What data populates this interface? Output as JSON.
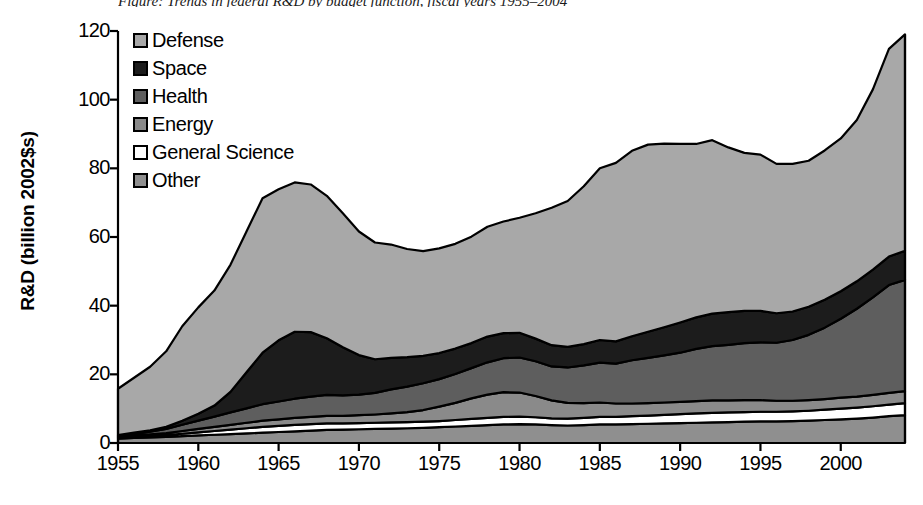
{
  "caption_fragment": "Figure: Trends in federal R&D by budget function, fiscal years 1955–2004",
  "axes": {
    "y_title": "R&D (billion 2002$s)",
    "y_ticks": [
      0,
      20,
      40,
      60,
      80,
      100,
      120
    ],
    "y_min": 0,
    "y_max": 120,
    "x_ticks": [
      1955,
      1960,
      1965,
      1970,
      1975,
      1980,
      1985,
      1990,
      1995,
      2000
    ],
    "x_min": 1955,
    "x_max": 2004
  },
  "legend": {
    "items": [
      {
        "label": "Defense",
        "color": "#a8a8a8"
      },
      {
        "label": "Space",
        "color": "#1c1c1c"
      },
      {
        "label": "Health",
        "color": "#5e5e5e"
      },
      {
        "label": "Energy",
        "color": "#8a8a8a"
      },
      {
        "label": "General Science",
        "color": "#ffffff"
      },
      {
        "label": "Other",
        "color": "#8f8f8f"
      }
    ]
  },
  "chart_data": {
    "type": "area",
    "stacked": true,
    "title": "",
    "xlabel": "",
    "ylabel": "R&D (billion 2002$s)",
    "xlim": [
      1955,
      2004
    ],
    "ylim": [
      0,
      120
    ],
    "grid": false,
    "legend_position": "top-left inside plot",
    "stack_order_bottom_to_top": [
      "Other",
      "General Science",
      "Energy",
      "Health",
      "Space",
      "Defense"
    ],
    "x": [
      1955,
      1956,
      1957,
      1958,
      1959,
      1960,
      1961,
      1962,
      1963,
      1964,
      1965,
      1966,
      1967,
      1968,
      1969,
      1970,
      1971,
      1972,
      1973,
      1974,
      1975,
      1976,
      1977,
      1978,
      1979,
      1980,
      1981,
      1982,
      1983,
      1984,
      1985,
      1986,
      1987,
      1988,
      1989,
      1990,
      1991,
      1992,
      1993,
      1994,
      1995,
      1996,
      1997,
      1998,
      1999,
      2000,
      2001,
      2002,
      2003,
      2004
    ],
    "series": [
      {
        "name": "Other",
        "color": "#8f8f8f",
        "values": [
          1.3,
          1.5,
          1.6,
          1.8,
          2.0,
          2.2,
          2.4,
          2.6,
          2.8,
          3.0,
          3.2,
          3.4,
          3.6,
          3.8,
          3.9,
          4.0,
          4.1,
          4.2,
          4.3,
          4.4,
          4.6,
          4.8,
          5.0,
          5.2,
          5.4,
          5.5,
          5.4,
          5.2,
          5.1,
          5.2,
          5.4,
          5.4,
          5.5,
          5.6,
          5.7,
          5.8,
          5.9,
          6.0,
          6.1,
          6.2,
          6.3,
          6.3,
          6.4,
          6.5,
          6.7,
          6.9,
          7.1,
          7.4,
          7.8,
          8.1
        ]
      },
      {
        "name": "General Science",
        "color": "#ffffff",
        "values": [
          0.2,
          0.3,
          0.4,
          0.5,
          0.7,
          0.9,
          1.1,
          1.3,
          1.5,
          1.7,
          1.8,
          1.9,
          1.9,
          1.9,
          1.8,
          1.8,
          1.8,
          1.8,
          1.8,
          1.8,
          1.8,
          1.9,
          2.0,
          2.1,
          2.2,
          2.2,
          2.1,
          2.0,
          2.0,
          2.1,
          2.2,
          2.2,
          2.3,
          2.4,
          2.5,
          2.6,
          2.7,
          2.8,
          2.8,
          2.8,
          2.8,
          2.8,
          2.8,
          2.9,
          3.0,
          3.1,
          3.2,
          3.3,
          3.4,
          3.5
        ]
      },
      {
        "name": "Energy",
        "color": "#8a8a8a",
        "values": [
          0.3,
          0.4,
          0.5,
          0.6,
          0.8,
          1.0,
          1.2,
          1.4,
          1.6,
          1.8,
          1.9,
          2.0,
          2.1,
          2.2,
          2.2,
          2.3,
          2.4,
          2.6,
          2.9,
          3.4,
          4.2,
          5.0,
          6.0,
          6.8,
          7.2,
          7.0,
          6.2,
          5.2,
          4.6,
          4.3,
          4.2,
          3.9,
          3.7,
          3.6,
          3.6,
          3.6,
          3.6,
          3.6,
          3.5,
          3.5,
          3.4,
          3.2,
          3.1,
          3.1,
          3.1,
          3.2,
          3.2,
          3.3,
          3.4,
          3.5
        ]
      },
      {
        "name": "Health",
        "color": "#5e5e5e",
        "values": [
          0.3,
          0.5,
          0.8,
          1.2,
          1.8,
          2.4,
          3.0,
          3.6,
          4.2,
          4.8,
          5.2,
          5.6,
          5.9,
          6.1,
          6.0,
          6.0,
          6.3,
          7.0,
          7.4,
          7.8,
          8.0,
          8.4,
          8.8,
          9.4,
          9.9,
          10.2,
          10.1,
          9.9,
          10.3,
          11.0,
          11.6,
          11.6,
          12.6,
          13.2,
          13.7,
          14.3,
          15.2,
          15.8,
          16.2,
          16.6,
          16.8,
          16.9,
          17.7,
          19.0,
          20.8,
          23.0,
          25.6,
          28.4,
          31.4,
          32.4
        ]
      },
      {
        "name": "Space",
        "color": "#1c1c1c",
        "values": [
          0.2,
          0.3,
          0.4,
          0.6,
          1.2,
          2.0,
          3.2,
          6.0,
          10.5,
          15.0,
          17.8,
          19.5,
          18.8,
          16.5,
          14.0,
          11.5,
          9.8,
          9.2,
          8.6,
          8.0,
          7.6,
          7.4,
          7.3,
          7.5,
          7.3,
          7.2,
          6.6,
          6.2,
          6.0,
          6.2,
          6.6,
          6.5,
          7.0,
          7.6,
          8.2,
          8.8,
          9.2,
          9.5,
          9.5,
          9.4,
          9.2,
          8.6,
          8.3,
          8.2,
          8.1,
          8.0,
          8.0,
          8.1,
          8.3,
          8.5
        ]
      },
      {
        "name": "Defense",
        "color": "#a8a8a8",
        "values": [
          13.5,
          16.0,
          18.5,
          22.0,
          27.5,
          31.0,
          33.5,
          37.0,
          41.0,
          45.0,
          44.0,
          43.5,
          43.0,
          41.5,
          39.0,
          36.0,
          34.0,
          33.0,
          31.5,
          30.5,
          30.5,
          30.5,
          31.0,
          32.0,
          32.5,
          33.5,
          36.5,
          40.0,
          42.5,
          46.0,
          50.0,
          52.0,
          54.0,
          54.5,
          53.5,
          52.0,
          50.5,
          50.5,
          48.0,
          46.0,
          45.5,
          43.5,
          43.0,
          42.5,
          43.5,
          44.5,
          47.0,
          52.5,
          60.5,
          63.0
        ]
      }
    ],
    "totals": [
      15.8,
      19.0,
      22.2,
      26.7,
      34.0,
      39.5,
      44.4,
      51.9,
      62.6,
      71.3,
      73.9,
      75.9,
      75.3,
      72.0,
      68.9,
      63.6,
      60.4,
      59.8,
      58.5,
      57.9,
      58.7,
      61.0,
      64.1,
      69.0,
      72.5,
      73.6,
      72.9,
      68.5,
      70.5,
      74.8,
      80.0,
      81.6,
      85.1,
      86.9,
      87.2,
      87.1,
      87.1,
      88.2,
      86.1,
      84.5,
      84.0,
      81.3,
      81.3,
      82.2,
      85.2,
      88.7,
      94.1,
      103.0,
      114.8,
      119.0
    ]
  }
}
